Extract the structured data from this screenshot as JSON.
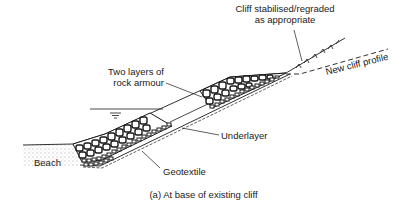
{
  "diagram": {
    "caption": "(a)  At base of existing cliff",
    "labels": {
      "cliff_stabilised_line1": "Cliff stabilised/regraded",
      "cliff_stabilised_line2": "as appropriate",
      "new_cliff_profile": "New cliff profile",
      "rock_armour_line1": "Two layers of",
      "rock_armour_line2": "rock armour",
      "underlayer": "Underlayer",
      "beach": "Beach",
      "geotextile": "Geotextile"
    },
    "components": [
      "beach",
      "rock armour (two layers)",
      "underlayer",
      "geotextile",
      "still water level",
      "existing cliff (stabilised/regraded)",
      "new cliff profile (dashed)"
    ],
    "colors": {
      "line": "#1a1a1a",
      "background": "#ffffff"
    }
  }
}
